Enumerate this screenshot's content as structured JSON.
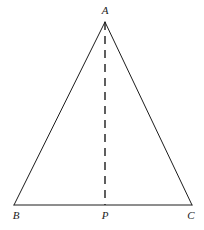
{
  "figure": {
    "type": "geometry-diagram",
    "background_color": "#ffffff",
    "stroke_color": "#1c1c1c",
    "stroke_width": 1,
    "canvas": {
      "width": 204,
      "height": 230
    },
    "vertices": [
      {
        "id": "A",
        "label": "A",
        "x": 105,
        "y": 22,
        "label_x": 105,
        "label_y": 10
      },
      {
        "id": "B",
        "label": "B",
        "x": 14,
        "y": 205,
        "label_x": 16,
        "label_y": 215
      },
      {
        "id": "P",
        "label": "P",
        "x": 105,
        "y": 205,
        "label_x": 105,
        "label_y": 215
      },
      {
        "id": "C",
        "label": "C",
        "x": 192,
        "y": 205,
        "label_x": 191,
        "label_y": 215
      }
    ],
    "solid_segments": [
      {
        "id": "AB",
        "from": "A",
        "to": "B",
        "x1": 105,
        "y1": 22,
        "x2": 14,
        "y2": 205
      },
      {
        "id": "AC",
        "from": "A",
        "to": "C",
        "x1": 105,
        "y1": 22,
        "x2": 192,
        "y2": 205
      },
      {
        "id": "BC",
        "from": "B",
        "to": "C",
        "x1": 14,
        "y1": 205,
        "x2": 192,
        "y2": 205
      }
    ],
    "dashed_segments": [
      {
        "id": "AP",
        "from": "A",
        "to": "P",
        "x1": 105,
        "y1": 22,
        "x2": 105,
        "y2": 205,
        "dash": "8 6"
      }
    ]
  }
}
